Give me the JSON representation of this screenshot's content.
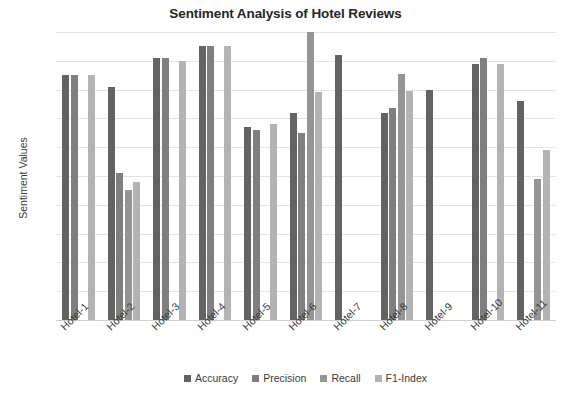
{
  "chart_data": {
    "type": "bar",
    "title": "Sentiment Analysis of Hotel Reviews",
    "xlabel": "",
    "ylabel": "Sentiment Values",
    "ylim": [
      0,
      1
    ],
    "ytick_labels": [
      "1",
      "0.9",
      "0.8",
      "0.7",
      "0.6",
      "0.5",
      "0.4",
      "0.3",
      "0.2",
      "0.1",
      "0"
    ],
    "ytick_values": [
      1,
      0.9,
      0.8,
      0.7,
      0.6,
      0.5,
      0.4,
      0.3,
      0.2,
      0.1,
      0
    ],
    "grid": true,
    "legend_position": "bottom",
    "categories": [
      "Hotel-1",
      "Hotel-2",
      "Hotel-3",
      "Hotel-4",
      "Hotel-5",
      "Hotel-6",
      "Hotel-7",
      "Hotel-8",
      "Hotel-9",
      "Hotel-10",
      "Hotel-11"
    ],
    "series": [
      {
        "name": "Accuracy",
        "color": "#636363",
        "values": [
          0.85,
          0.81,
          0.91,
          0.95,
          0.67,
          0.72,
          0.92,
          0.72,
          0.8,
          0.89,
          0.76
        ]
      },
      {
        "name": "Precision",
        "color": "#7f7f7f",
        "values": [
          0.85,
          0.51,
          0.91,
          0.95,
          0.66,
          0.65,
          null,
          0.735,
          null,
          0.91,
          null
        ]
      },
      {
        "name": "Recall",
        "color": "#959595",
        "values": [
          null,
          0.45,
          null,
          null,
          null,
          1.0,
          null,
          0.855,
          null,
          null,
          0.49
        ]
      },
      {
        "name": "F1-Index",
        "color": "#b3b3b3",
        "values": [
          0.85,
          0.48,
          0.9,
          0.95,
          0.68,
          0.79,
          null,
          0.795,
          null,
          0.89,
          0.59
        ]
      }
    ]
  },
  "legend": {
    "items": [
      {
        "label": "Accuracy",
        "color": "#636363"
      },
      {
        "label": "Precision",
        "color": "#7f7f7f"
      },
      {
        "label": "Recall",
        "color": "#959595"
      },
      {
        "label": "F1-Index",
        "color": "#b3b3b3"
      }
    ]
  }
}
